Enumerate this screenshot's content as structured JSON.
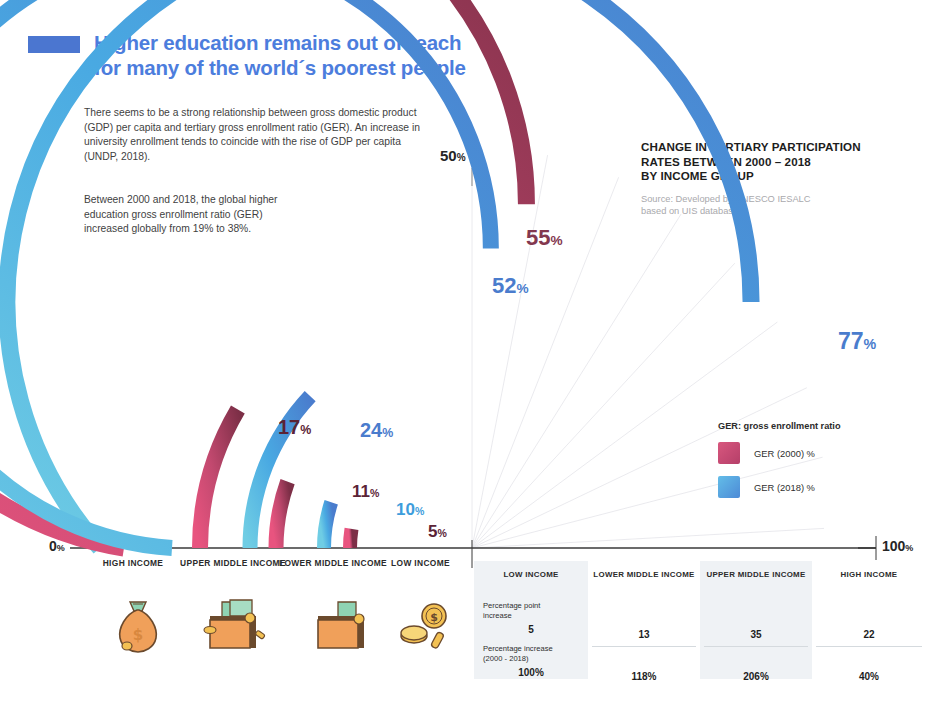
{
  "header": {
    "swatch_color": "#4b76d0",
    "title": "Higher education remains out of reach for many of the world´s poorest people",
    "intro_paragraph": "There seems to be a strong relationship between gross domestic product (GDP) per capita and tertiary gross enrollment ratio (GER). An increase in university enrollment tends to coincide with the rise of GDP per capita (UNDP, 2018).",
    "second_paragraph": "Between 2000 and 2018, the global higher education gross enrollment ratio (GER) increased globally from 19% to 38%."
  },
  "right_heading": {
    "line1": "CHANGE IN TERTIARY PARTICIPATION",
    "line2": "RATES BETWEEN 2000 – 2018",
    "line3": "BY INCOME GROUP",
    "source_line1": "Source: Developed by UNESCO IESALC",
    "source_line2": "based on UIS database"
  },
  "legend": {
    "title": "GER: gross enrollment ratio",
    "items": [
      {
        "label": "GER (2000) %",
        "color": "#c64f79"
      },
      {
        "label": "GER (2018) %",
        "color": "#52a8e0"
      }
    ]
  },
  "axis": {
    "min_label": "0",
    "min_suffix": "%",
    "mid_label": "50",
    "mid_suffix": "%",
    "max_label": "100",
    "max_suffix": "%"
  },
  "chart_data": {
    "type": "bar",
    "title": "CHANGE IN TERTIARY PARTICIPATION RATES BETWEEN 2000 – 2018 BY INCOME GROUP",
    "subtitle": "Source: Developed by UNESCO IESALC based on UIS database",
    "xlabel": "",
    "ylabel": "",
    "ylim": [
      0,
      100
    ],
    "grid": true,
    "legend_position": "right",
    "categories": [
      "HIGH INCOME",
      "UPPER MIDDLE INCOME",
      "LOWER MIDDLE INCOME",
      "LOW INCOME"
    ],
    "series": [
      {
        "name": "GER (2000) %",
        "color": "#c64f79",
        "values": [
          55,
          17,
          11,
          5
        ]
      },
      {
        "name": "GER (2018) %",
        "color": "#52a8e0",
        "values": [
          77,
          52,
          24,
          10
        ]
      }
    ],
    "value_labels": [
      {
        "series": "GER (2018) %",
        "category": "HIGH INCOME",
        "value": 77,
        "text": "77",
        "suffix": "%",
        "color": "#4a7ccd"
      },
      {
        "series": "GER (2000) %",
        "category": "HIGH INCOME",
        "value": 55,
        "text": "55",
        "suffix": "%",
        "color": "#83384f"
      },
      {
        "series": "GER (2018) %",
        "category": "UPPER MIDDLE INCOME",
        "value": 52,
        "text": "52",
        "suffix": "%",
        "color": "#4a7ccd"
      },
      {
        "series": "GER (2000) %",
        "category": "UPPER MIDDLE INCOME",
        "value": 17,
        "text": "17",
        "suffix": "%",
        "color": "#5b2336"
      },
      {
        "series": "GER (2018) %",
        "category": "LOWER MIDDLE INCOME",
        "value": 24,
        "text": "24",
        "suffix": "%",
        "color": "#4a7ccd"
      },
      {
        "series": "GER (2000) %",
        "category": "LOWER MIDDLE INCOME",
        "value": 11,
        "text": "11",
        "suffix": "%",
        "color": "#5b2336"
      },
      {
        "series": "GER (2018) %",
        "category": "LOW INCOME",
        "value": 10,
        "text": "10",
        "suffix": "%",
        "color": "#3d9ddc"
      },
      {
        "series": "GER (2000) %",
        "category": "LOW INCOME",
        "value": 5,
        "text": "5",
        "suffix": "%",
        "color": "#5b2336"
      }
    ]
  },
  "category_icons": [
    {
      "category": "HIGH INCOME",
      "icon": "money-bag-icon"
    },
    {
      "category": "UPPER MIDDLE INCOME",
      "icon": "full-wallet-icon"
    },
    {
      "category": "LOWER MIDDLE INCOME",
      "icon": "wallet-icon"
    },
    {
      "category": "LOW INCOME",
      "icon": "coins-icon"
    }
  ],
  "table": {
    "columns": [
      {
        "header": "LOW INCOME",
        "shaded": true
      },
      {
        "header": "LOWER MIDDLE INCOME",
        "shaded": false
      },
      {
        "header": "UPPER MIDDLE INCOME",
        "shaded": true
      },
      {
        "header": "HIGH INCOME",
        "shaded": false
      }
    ],
    "rows": [
      {
        "label_line1": "Percentage point",
        "label_line2": "increase",
        "values": [
          "5",
          "13",
          "35",
          "22"
        ]
      },
      {
        "label_line1": "Percentage increase",
        "label_line2": "(2000 - 2018)",
        "values": [
          "100%",
          "118%",
          "206%",
          "40%"
        ]
      }
    ]
  }
}
